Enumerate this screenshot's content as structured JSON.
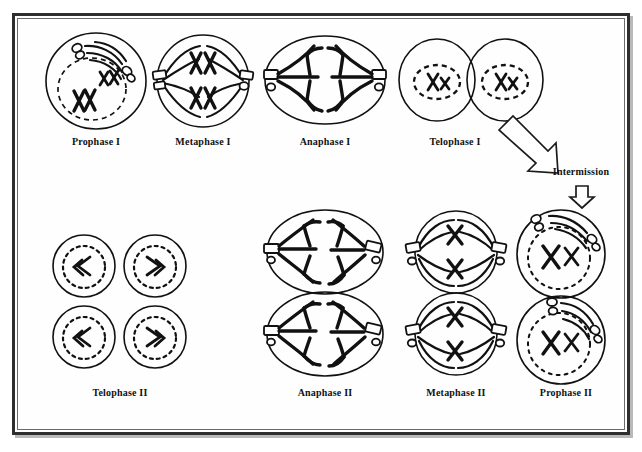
{
  "diagram": {
    "border_color": "#2e2e2e",
    "ink_color": "#111111",
    "background_color": "#ffffff"
  },
  "stages": [
    {
      "id": "prophase-1",
      "label": "Prophase I",
      "row": "top",
      "cells": 1,
      "shape": "circle",
      "note": "intact dashed nuclear envelope with paired XX chromosomes and centrioles"
    },
    {
      "id": "metaphase-1",
      "label": "Metaphase I",
      "row": "top",
      "cells": 1,
      "shape": "circle",
      "note": "tetrads aligned at equator between two centrioles"
    },
    {
      "id": "anaphase-1",
      "label": "Anaphase I",
      "row": "top",
      "cells": 1,
      "shape": "ellipse",
      "note": "homologous chromosomes pulled to opposite poles"
    },
    {
      "id": "telophase-1",
      "label": "Telophase I",
      "row": "top",
      "cells": 2,
      "shape": "circle",
      "note": "two daughter cells with reforming dashed nuclear envelopes"
    },
    {
      "id": "telophase-2",
      "label": "Telophase II",
      "row": "bottom",
      "cells": 4,
      "shape": "circle",
      "note": "four haploid daughter cells"
    },
    {
      "id": "anaphase-2",
      "label": "Anaphase II",
      "row": "bottom",
      "cells": 2,
      "shape": "ellipse",
      "note": "sister chromatids pulled to opposite poles"
    },
    {
      "id": "metaphase-2",
      "label": "Metaphase II",
      "row": "bottom",
      "cells": 2,
      "shape": "circle",
      "note": "chromosomes aligned at equator"
    },
    {
      "id": "prophase-2",
      "label": "Prophase II",
      "row": "bottom",
      "cells": 2,
      "shape": "circle",
      "note": "nuclear envelope breaking down, centrioles migrating"
    }
  ],
  "connectors": {
    "diagonal_arrow": {
      "name": "intermission-diagonal-arrow",
      "direction": "down-right"
    },
    "intermission_label": "Intermission",
    "down_arrow": {
      "name": "intermission-down-arrow",
      "direction": "down"
    }
  }
}
